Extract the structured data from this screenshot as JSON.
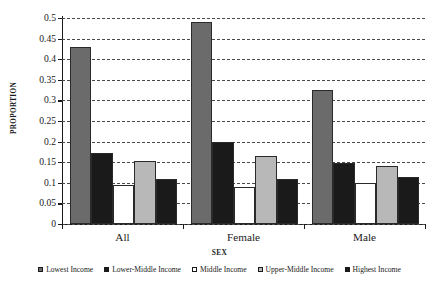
{
  "chart_data": {
    "type": "bar",
    "title": "",
    "xlabel": "SEX",
    "ylabel": "PROPORTION",
    "categories": [
      "All",
      "Female",
      "Male"
    ],
    "series": [
      {
        "name": "Lowest Income",
        "color": "#6b6b6b",
        "values": [
          0.43,
          0.49,
          0.325
        ]
      },
      {
        "name": "Lower-Middle Income",
        "color": "#1a1a1a",
        "values": [
          0.173,
          0.198,
          0.148
        ]
      },
      {
        "name": "Middle Income",
        "color": "#ffffff",
        "values": [
          0.095,
          0.09,
          0.1
        ]
      },
      {
        "name": "Upper-Middle Income",
        "color": "#b8b8b8",
        "values": [
          0.153,
          0.165,
          0.14
        ]
      },
      {
        "name": "Highest Income",
        "color": "#1a1a1a",
        "values": [
          0.11,
          0.11,
          0.115
        ]
      }
    ],
    "ylim": [
      0,
      0.5
    ],
    "yticks": [
      "0",
      "0.05",
      "0.1",
      "0.15",
      "0.2",
      "0.25",
      "0.3",
      "0.35",
      "0.4",
      "0.45",
      "0.5"
    ],
    "ytick_values": [
      0,
      0.05,
      0.1,
      0.15,
      0.2,
      0.25,
      0.3,
      0.35,
      0.4,
      0.45,
      0.5
    ],
    "grid": true,
    "grid_style": "dashed",
    "legend_position": "bottom"
  },
  "axes": {
    "y_title": "PROPORTION",
    "x_title": "SEX"
  }
}
